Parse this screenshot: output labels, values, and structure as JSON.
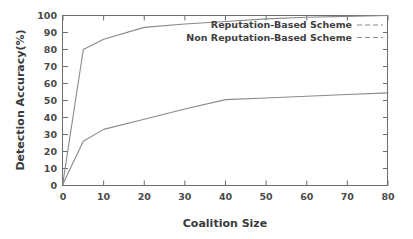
{
  "chart_data": {
    "type": "line",
    "title": "",
    "xlabel": "Coalition Size",
    "ylabel": "Detection Accuracy(%)",
    "xlim": [
      0,
      80
    ],
    "ylim": [
      0,
      100
    ],
    "xticks": [
      0,
      10,
      20,
      30,
      40,
      50,
      60,
      70,
      80
    ],
    "xtick_labels": [
      "0",
      "10",
      "20",
      "30",
      "40",
      "50",
      "60",
      "70",
      "80"
    ],
    "yticks": [
      0,
      10,
      20,
      30,
      40,
      50,
      60,
      70,
      80,
      90,
      100
    ],
    "ytick_labels": [
      "0",
      "10",
      "20",
      "30",
      "40",
      "50",
      "60",
      "70",
      "80",
      "90",
      "100"
    ],
    "grid": false,
    "legend_position": "top-right",
    "series": [
      {
        "name": "Reputation-Based  Scheme",
        "x": [
          0,
          5,
          10,
          20,
          30,
          40,
          50,
          60,
          70,
          80
        ],
        "values": [
          2,
          80,
          86,
          93,
          95,
          96.5,
          98,
          99,
          99.5,
          100
        ]
      },
      {
        "name": "Non Reputation-Based Scheme",
        "x": [
          0,
          5,
          10,
          20,
          30,
          40,
          50,
          60,
          70,
          80
        ],
        "values": [
          1,
          26,
          33,
          39,
          45,
          50.5,
          51.5,
          52.5,
          53.5,
          54.5
        ]
      }
    ]
  },
  "axes": {
    "x_title": "Coalition Size",
    "y_title": "Detection Accuracy(%)"
  },
  "legend": {
    "entries": [
      {
        "label": "Reputation-Based  Scheme",
        "sample": "dashed-line"
      },
      {
        "label": "Non Reputation-Based Scheme",
        "sample": "dashed-line"
      }
    ]
  },
  "colors": {
    "background": "#ffffff",
    "axis": "#6e6e6e",
    "series": "#8a8a8a",
    "text": "#3f3f3f"
  }
}
